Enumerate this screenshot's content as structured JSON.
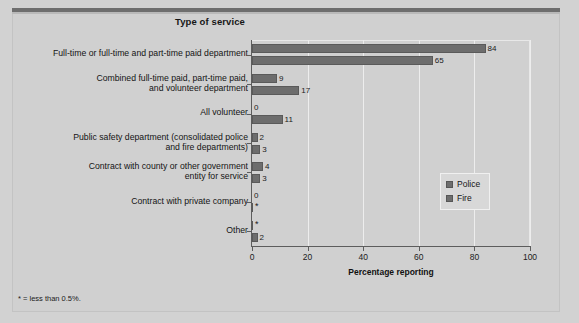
{
  "chart_data": {
    "type": "bar",
    "orientation": "horizontal",
    "title": "Type of service",
    "xlabel": "Percentage reporting",
    "ylabel": "",
    "xlim": [
      0,
      100
    ],
    "xticks": [
      0,
      20,
      40,
      60,
      80,
      100
    ],
    "grid": "vertical",
    "legend_position": "middle-right",
    "footnote": "* = less than 0.5%.",
    "categories": [
      "Full-time or full-time and part-time paid department",
      "Combined full-time paid, part-time paid,\nand volunteer department",
      "All volunteer",
      "Public safety department (consolidated police\nand fire departments)",
      "Contract with county or other government\nentity for service",
      "Contract with private company",
      "Other"
    ],
    "series": [
      {
        "name": "Police",
        "color": "#6d6d6d",
        "values": [
          84,
          9,
          0,
          2,
          4,
          0,
          0.4
        ],
        "labels": [
          "84",
          "9",
          "0",
          "2",
          "4",
          "0",
          "*"
        ]
      },
      {
        "name": "Fire",
        "color": "#6d6d6d",
        "values": [
          65,
          17,
          11,
          3,
          3,
          0.4,
          2
        ],
        "labels": [
          "65",
          "17",
          "11",
          "3",
          "3",
          "*",
          "2"
        ]
      }
    ]
  }
}
